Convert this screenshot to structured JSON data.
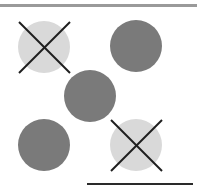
{
  "colors": {
    "top_border": "#9a9a9a",
    "light_circle": "#d9d9d9",
    "dark_circle": "#7a7a7a",
    "cross_stroke": "#1e1e1e",
    "baseline": "#2a2a2a"
  },
  "circles": [
    {
      "id": 1,
      "cx": 44,
      "cy": 47,
      "r": 26,
      "fill": "light",
      "crossed": true
    },
    {
      "id": 2,
      "cx": 136,
      "cy": 46,
      "r": 26,
      "fill": "dark",
      "crossed": false
    },
    {
      "id": 3,
      "cx": 90,
      "cy": 96,
      "r": 26,
      "fill": "dark",
      "crossed": false
    },
    {
      "id": 4,
      "cx": 44,
      "cy": 145,
      "r": 26,
      "fill": "dark",
      "crossed": false
    },
    {
      "id": 5,
      "cx": 136,
      "cy": 145,
      "r": 26,
      "fill": "light",
      "crossed": true
    }
  ]
}
